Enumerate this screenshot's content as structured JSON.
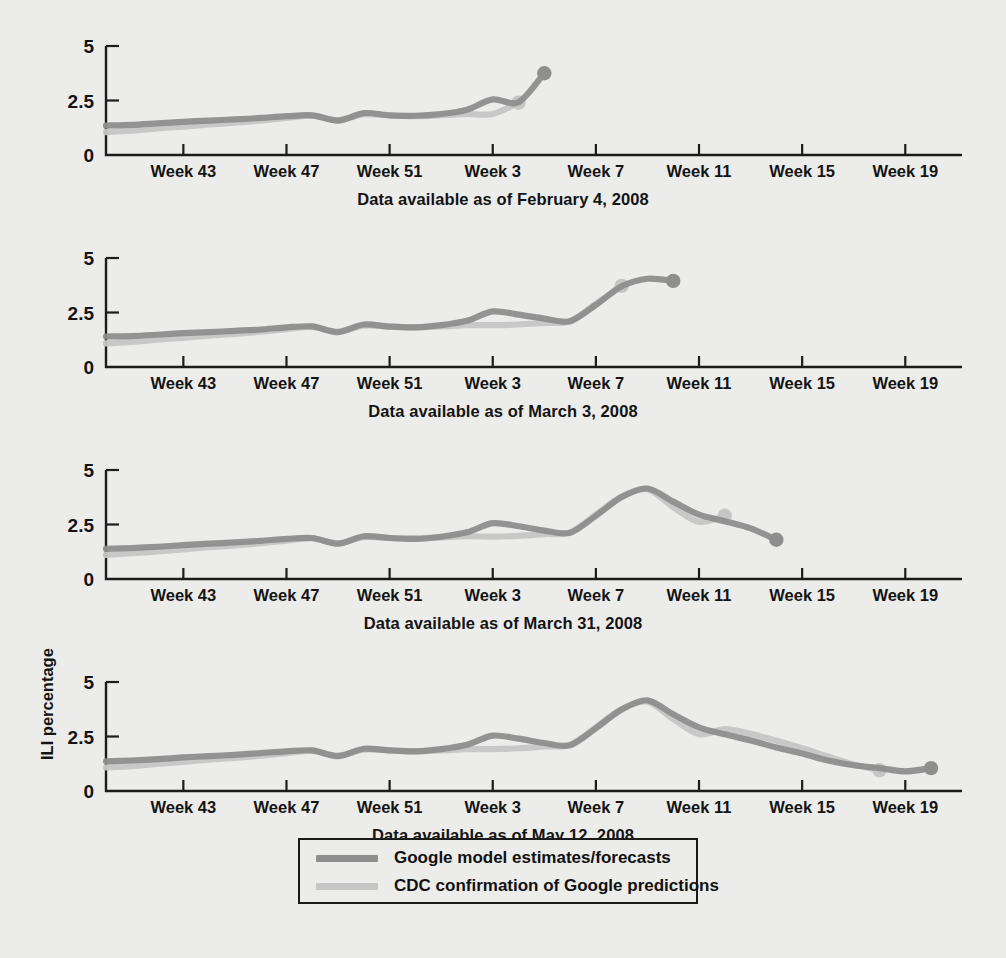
{
  "figure": {
    "y_axis_label": "ILI percentage",
    "x_tick_labels": [
      "Week 43",
      "Week 47",
      "Week 51",
      "Week 3",
      "Week 7",
      "Week 11",
      "Week 15",
      "Week 19"
    ],
    "y_tick_labels": [
      "0",
      "2.5",
      "5"
    ],
    "series_colors": {
      "google": "#8e8e8e",
      "cdc": "#c2c2c2"
    }
  },
  "legend": {
    "items": [
      {
        "label": "Google model estimates/forecasts",
        "color": "#8e8e8e"
      },
      {
        "label": "CDC confirmation of Google predictions",
        "color": "#c6c6c6"
      }
    ]
  },
  "chart_data": {
    "type": "line",
    "title": "",
    "xlabel": "",
    "ylabel": "ILI percentage",
    "ylim": [
      0,
      5
    ],
    "yticks": [
      0,
      2.5,
      5
    ],
    "grid": false,
    "legend_position": "bottom-center",
    "x_tick_labels": [
      "Week 43",
      "Week 47",
      "Week 51",
      "Week 3",
      "Week 7",
      "Week 11",
      "Week 15",
      "Week 19"
    ],
    "x_tick_weeks": [
      43,
      47,
      51,
      3,
      7,
      11,
      15,
      19
    ],
    "x_index_range": [
      39,
      21
    ],
    "panels": [
      {
        "caption": "Data available as of February 4, 2008",
        "series": [
          {
            "name": "Google model estimates/forecasts",
            "color": "#8e8e8e",
            "end_marker": true,
            "x": [
              40,
              41,
              42,
              43,
              44,
              45,
              46,
              47,
              48,
              49,
              50,
              51,
              52,
              1,
              2,
              3,
              4,
              5
            ],
            "values": [
              1.35,
              1.38,
              1.45,
              1.52,
              1.58,
              1.63,
              1.7,
              1.78,
              1.82,
              1.58,
              1.92,
              1.82,
              1.8,
              1.88,
              2.08,
              2.55,
              2.42,
              3.75
            ]
          },
          {
            "name": "CDC confirmation of Google predictions",
            "color": "#c6c6c6",
            "end_marker": true,
            "x": [
              40,
              41,
              42,
              43,
              44,
              45,
              46,
              47,
              48,
              49,
              50,
              51,
              52,
              1,
              2,
              3,
              4
            ],
            "values": [
              1.05,
              1.12,
              1.22,
              1.3,
              1.4,
              1.48,
              1.58,
              1.7,
              1.8,
              1.6,
              1.86,
              1.82,
              1.78,
              1.82,
              1.88,
              1.88,
              2.4
            ]
          }
        ]
      },
      {
        "caption": "Data available as of March 3, 2008",
        "series": [
          {
            "name": "Google model estimates/forecasts",
            "color": "#8e8e8e",
            "end_marker": true,
            "x": [
              40,
              41,
              42,
              43,
              44,
              45,
              46,
              47,
              48,
              49,
              50,
              51,
              52,
              1,
              2,
              3,
              4,
              5,
              6,
              7,
              8,
              9,
              10
            ],
            "values": [
              1.4,
              1.42,
              1.48,
              1.55,
              1.6,
              1.66,
              1.72,
              1.82,
              1.86,
              1.6,
              1.95,
              1.85,
              1.82,
              1.92,
              2.12,
              2.55,
              2.4,
              2.22,
              2.1,
              2.85,
              3.7,
              4.05,
              3.95
            ]
          },
          {
            "name": "CDC confirmation of Google predictions",
            "color": "#c6c6c6",
            "end_marker": true,
            "x": [
              40,
              41,
              42,
              43,
              44,
              45,
              46,
              47,
              48,
              49,
              50,
              51,
              52,
              1,
              2,
              3,
              4,
              5,
              6,
              7,
              8
            ],
            "values": [
              1.08,
              1.15,
              1.25,
              1.34,
              1.44,
              1.52,
              1.62,
              1.74,
              1.84,
              1.62,
              1.9,
              1.86,
              1.82,
              1.86,
              1.92,
              1.92,
              1.95,
              2.02,
              2.1,
              2.9,
              3.72
            ]
          }
        ]
      },
      {
        "caption": "Data available as of March 31, 2008",
        "series": [
          {
            "name": "Google model estimates/forecasts",
            "color": "#8e8e8e",
            "end_marker": true,
            "x": [
              40,
              41,
              42,
              43,
              44,
              45,
              46,
              47,
              48,
              49,
              50,
              51,
              52,
              1,
              2,
              3,
              4,
              5,
              6,
              7,
              8,
              9,
              10,
              11,
              12,
              13,
              14
            ],
            "values": [
              1.38,
              1.42,
              1.48,
              1.55,
              1.62,
              1.68,
              1.75,
              1.84,
              1.88,
              1.62,
              1.96,
              1.88,
              1.84,
              1.94,
              2.14,
              2.56,
              2.42,
              2.22,
              2.12,
              2.9,
              3.76,
              4.15,
              3.55,
              2.95,
              2.65,
              2.32,
              1.8
            ]
          },
          {
            "name": "CDC confirmation of Google predictions",
            "color": "#c6c6c6",
            "end_marker": true,
            "x": [
              40,
              41,
              42,
              43,
              44,
              45,
              46,
              47,
              48,
              49,
              50,
              51,
              52,
              1,
              2,
              3,
              4,
              5,
              6,
              7,
              8,
              9,
              10,
              11,
              12
            ],
            "values": [
              1.1,
              1.18,
              1.26,
              1.36,
              1.46,
              1.54,
              1.64,
              1.76,
              1.86,
              1.64,
              1.92,
              1.88,
              1.86,
              1.9,
              1.96,
              1.94,
              1.98,
              2.06,
              2.14,
              2.96,
              3.78,
              4.12,
              3.3,
              2.62,
              2.9
            ]
          }
        ]
      },
      {
        "caption": "Data available as of May 12, 2008",
        "series": [
          {
            "name": "Google model estimates/forecasts",
            "color": "#8e8e8e",
            "end_marker": true,
            "x": [
              40,
              41,
              42,
              43,
              44,
              45,
              46,
              47,
              48,
              49,
              50,
              51,
              52,
              1,
              2,
              3,
              4,
              5,
              6,
              7,
              8,
              9,
              10,
              11,
              12,
              13,
              14,
              15,
              16,
              17,
              18,
              19,
              20
            ],
            "values": [
              1.36,
              1.4,
              1.46,
              1.54,
              1.6,
              1.66,
              1.74,
              1.82,
              1.86,
              1.6,
              1.94,
              1.86,
              1.82,
              1.92,
              2.12,
              2.54,
              2.4,
              2.2,
              2.1,
              2.88,
              3.74,
              4.16,
              3.52,
              2.92,
              2.6,
              2.32,
              2.0,
              1.72,
              1.4,
              1.18,
              1.05,
              0.9,
              1.05
            ]
          },
          {
            "name": "CDC confirmation of Google predictions",
            "color": "#c6c6c6",
            "end_marker": true,
            "x": [
              40,
              41,
              42,
              43,
              44,
              45,
              46,
              47,
              48,
              49,
              50,
              51,
              52,
              1,
              2,
              3,
              4,
              5,
              6,
              7,
              8,
              9,
              10,
              11,
              12,
              13,
              14,
              15,
              16,
              17,
              18
            ],
            "values": [
              1.08,
              1.14,
              1.24,
              1.34,
              1.44,
              1.52,
              1.62,
              1.74,
              1.84,
              1.62,
              1.9,
              1.86,
              1.82,
              1.86,
              1.92,
              1.92,
              1.96,
              2.04,
              2.12,
              2.92,
              3.76,
              4.1,
              3.3,
              2.6,
              2.84,
              2.62,
              2.3,
              1.96,
              1.58,
              1.22,
              0.95
            ]
          }
        ]
      }
    ]
  }
}
